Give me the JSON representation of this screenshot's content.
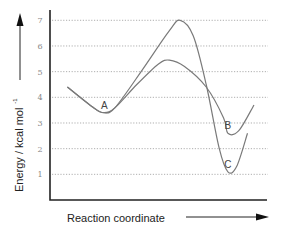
{
  "chart_data": {
    "type": "line",
    "title": "",
    "xlabel": "Reaction coordinate",
    "ylabel": "Energy / kcal mol",
    "ylabel_superscript": "-1",
    "ylim": [
      0,
      7
    ],
    "yticks": [
      1,
      2,
      3,
      4,
      5,
      6,
      7
    ],
    "grid": true,
    "legend": null,
    "annotations": [
      {
        "text": "A",
        "x": 0.25,
        "y": 3.4
      },
      {
        "text": "B",
        "x": 0.82,
        "y": 2.6
      },
      {
        "text": "C",
        "x": 0.82,
        "y": 1.1
      }
    ],
    "series": [
      {
        "name": "Path to B (lower barrier)",
        "points": [
          [
            0.08,
            4.4
          ],
          [
            0.2,
            3.6
          ],
          [
            0.25,
            3.4
          ],
          [
            0.3,
            3.6
          ],
          [
            0.4,
            4.5
          ],
          [
            0.5,
            5.3
          ],
          [
            0.55,
            5.45
          ],
          [
            0.62,
            5.2
          ],
          [
            0.72,
            4.4
          ],
          [
            0.8,
            3.2
          ],
          [
            0.82,
            2.6
          ],
          [
            0.87,
            2.7
          ],
          [
            0.94,
            3.7
          ]
        ]
      },
      {
        "name": "Path to C (higher barrier)",
        "points": [
          [
            0.08,
            4.4
          ],
          [
            0.2,
            3.6
          ],
          [
            0.25,
            3.4
          ],
          [
            0.3,
            3.6
          ],
          [
            0.42,
            5.0
          ],
          [
            0.55,
            6.6
          ],
          [
            0.6,
            7.0
          ],
          [
            0.66,
            6.4
          ],
          [
            0.72,
            4.5
          ],
          [
            0.78,
            2.0
          ],
          [
            0.82,
            1.1
          ],
          [
            0.86,
            1.3
          ],
          [
            0.91,
            2.6
          ]
        ]
      }
    ]
  },
  "axes": {
    "y_arrow": "up-arrow",
    "x_arrow": "right-arrow"
  }
}
